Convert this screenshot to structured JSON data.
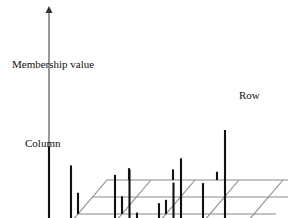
{
  "figure": {
    "type": "3d-stem-plot",
    "background": "#ffffff",
    "axes": {
      "vertical": {
        "label": "Membership value",
        "name": "membership-value-axis"
      },
      "right": {
        "label": "Row",
        "name": "row-axis"
      },
      "left": {
        "label": "Column",
        "name": "column-axis"
      }
    },
    "colors": {
      "grid": "#8a8a8a",
      "stem": "#111111",
      "axis": "#555555",
      "text": "#111111"
    }
  },
  "chart_data": {
    "type": "scatter",
    "title": "",
    "xlabel": "Row",
    "ylabel": "Column",
    "zlabel": "Membership value",
    "grid": true,
    "projection": {
      "origin_x": 107,
      "origin_y": 180,
      "row_dx": 22.0,
      "row_dy": 0.0,
      "col_dx": -14.5,
      "col_dy": 17.0,
      "rows": 5,
      "cols": 4,
      "plane_z": 0
    },
    "stems": [
      {
        "row": 0,
        "col": 4,
        "value": 0.86
      },
      {
        "row": 1,
        "col": 4,
        "value": 0.7
      },
      {
        "row": 2,
        "col": 4,
        "value": 0.08
      },
      {
        "row": 3,
        "col": 4,
        "value": 0.62
      },
      {
        "row": 3,
        "col": 3,
        "value": 0.52
      },
      {
        "row": 4,
        "col": 4,
        "value": 0.3
      },
      {
        "row": 5,
        "col": 4,
        "value": 0.38
      },
      {
        "row": 5,
        "col": 3,
        "value": 0.41
      },
      {
        "row": 6,
        "col": 4,
        "value": 0.76
      },
      {
        "row": 7,
        "col": 4,
        "value": 0.55
      },
      {
        "row": 8,
        "col": 4,
        "value": 1.0
      },
      {
        "row": 0,
        "col": 2,
        "value": 0.18
      },
      {
        "row": 2,
        "col": 2,
        "value": 0.15
      },
      {
        "row": 4,
        "col": 2,
        "value": 0.12
      },
      {
        "row": 1,
        "col": 0,
        "value": 0.1
      },
      {
        "row": 3,
        "col": 0,
        "value": 0.09
      },
      {
        "row": 5,
        "col": 0,
        "value": 0.07
      }
    ]
  }
}
